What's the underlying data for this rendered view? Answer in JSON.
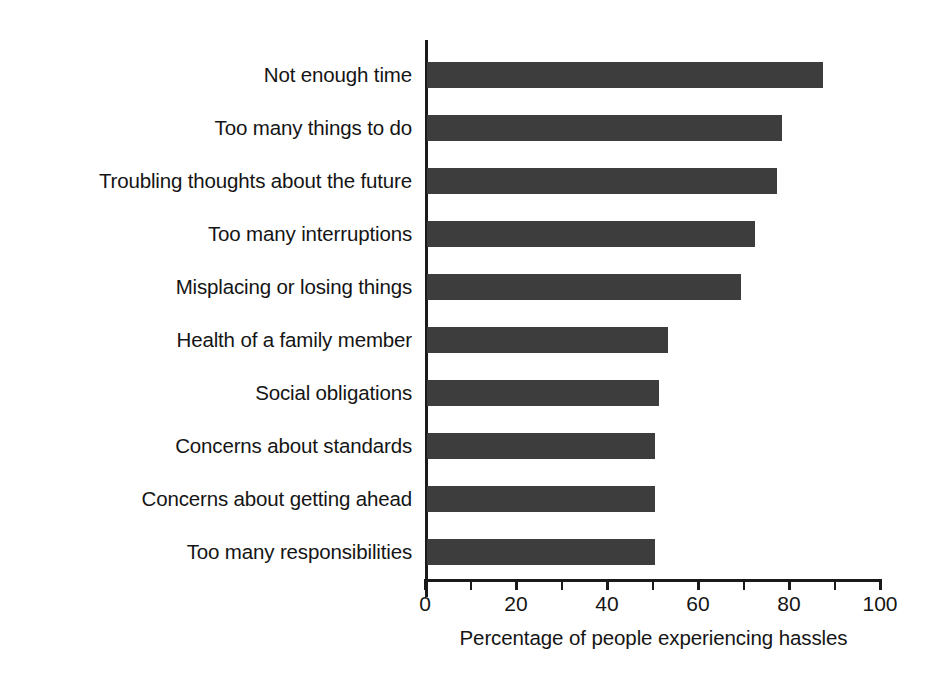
{
  "chart_data": {
    "type": "bar",
    "orientation": "horizontal",
    "title": "",
    "xlabel": "Percentage of people experiencing hassles",
    "ylabel": "",
    "xlim": [
      0,
      100
    ],
    "xticks": [
      0,
      20,
      40,
      60,
      80,
      100
    ],
    "xtick_labels": [
      "0",
      "20",
      "40",
      "60",
      "80",
      "100"
    ],
    "minor_tick_step": 10,
    "grid": false,
    "legend": null,
    "bar_color": "#3d3d3d",
    "axis_color": "#1a1a1a",
    "categories": [
      "Not enough time",
      "Too many things to do",
      "Troubling thoughts about the future",
      "Too many interruptions",
      "Misplacing or losing things",
      "Health of a family member",
      "Social obligations",
      "Concerns about standards",
      "Concerns about getting ahead",
      "Too many responsibilities"
    ],
    "values": [
      87,
      78,
      77,
      72,
      69,
      53,
      51,
      50,
      50,
      50
    ]
  }
}
